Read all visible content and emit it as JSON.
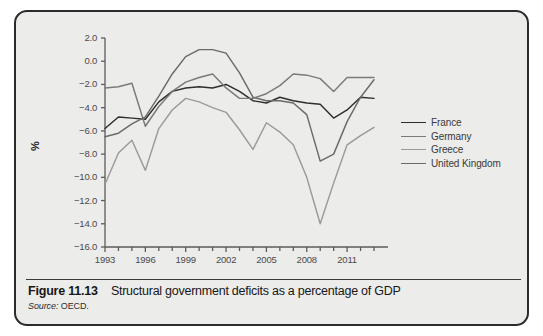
{
  "caption": {
    "figure_number": "Figure 11.13",
    "title": "Structural government deficits as a percentage of GDP",
    "source_label": "Source:",
    "source_value": "OECD."
  },
  "chart_data": {
    "type": "line",
    "title": "Structural government deficits as a percentage of GDP",
    "xlabel": "",
    "ylabel": "%",
    "xlim": [
      1993,
      2013
    ],
    "ylim": [
      -16.0,
      2.0
    ],
    "grid": false,
    "legend_position": "right",
    "x": [
      1993,
      1994,
      1995,
      1996,
      1997,
      1998,
      1999,
      2000,
      2001,
      2002,
      2003,
      2004,
      2005,
      2006,
      2007,
      2008,
      2009,
      2010,
      2011,
      2012,
      2013
    ],
    "y_ticks": [
      2.0,
      0.0,
      -2.0,
      -4.0,
      -6.0,
      -8.0,
      -10.0,
      -12.0,
      -14.0,
      -16.0
    ],
    "y_tick_labels": [
      "2.0",
      "0.0",
      "-2.0",
      "-4.0",
      "-6.0",
      "-8.0",
      "-10.0",
      "-12.0",
      "-14.0",
      "-16.0"
    ],
    "x_ticks": [
      1993,
      1996,
      1999,
      2002,
      2005,
      2008,
      2011
    ],
    "x_tick_labels": [
      "1993",
      "1996",
      "1999",
      "2002",
      "2005",
      "2008",
      "2011"
    ],
    "series": [
      {
        "name": "France",
        "color": "#2e2e2e",
        "values": [
          -5.8,
          -4.8,
          -4.9,
          -5.0,
          -3.5,
          -2.6,
          -2.3,
          -2.2,
          -2.3,
          -2.0,
          -2.6,
          -3.4,
          -3.6,
          -3.1,
          -3.4,
          -3.6,
          -3.7,
          -4.9,
          -4.2,
          -3.1,
          -3.2
        ]
      },
      {
        "name": "Germany",
        "color": "#7a7a7a",
        "values": [
          -2.3,
          -2.2,
          -1.9,
          -5.6,
          -3.9,
          -2.6,
          -1.8,
          -1.4,
          -1.1,
          -2.3,
          -3.2,
          -3.2,
          -2.8,
          -2.1,
          -1.1,
          -1.2,
          -1.5,
          -2.6,
          -1.4,
          -1.4,
          -1.4
        ]
      },
      {
        "name": "Greece",
        "color": "#9a9a9a",
        "values": [
          -10.6,
          -7.9,
          -6.8,
          -9.4,
          -5.8,
          -4.2,
          -3.2,
          -3.5,
          -4.0,
          -4.4,
          -5.9,
          -7.6,
          -5.3,
          -6.1,
          -7.2,
          -10.0,
          -14.0,
          -10.5,
          -7.2,
          -6.4,
          -5.7
        ]
      },
      {
        "name": "United Kingdom",
        "color": "#6a6a6a",
        "values": [
          -6.5,
          -6.2,
          -5.4,
          -4.8,
          -3.0,
          -1.1,
          0.4,
          1.0,
          1.0,
          0.7,
          -1.0,
          -3.1,
          -3.4,
          -3.4,
          -3.6,
          -4.6,
          -8.6,
          -8.0,
          -5.2,
          -3.1,
          -1.6
        ]
      }
    ]
  }
}
